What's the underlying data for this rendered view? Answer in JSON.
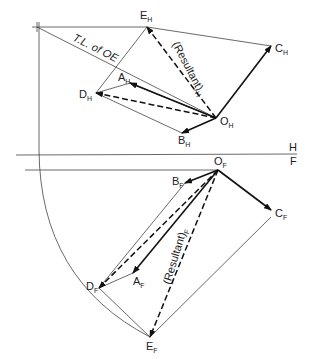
{
  "diagram": {
    "type": "descriptive-geometry-vector-resultant",
    "top_view": {
      "points": {
        "O_H": {
          "label": "O",
          "sub": "H",
          "x": 216,
          "y": 118
        },
        "A_H": {
          "label": "A",
          "sub": "H",
          "x": 130,
          "y": 83
        },
        "B_H": {
          "label": "B",
          "sub": "H",
          "x": 182,
          "y": 133
        },
        "C_H": {
          "label": "C",
          "sub": "H",
          "x": 271,
          "y": 46
        },
        "D_H": {
          "label": "D",
          "sub": "H",
          "x": 96,
          "y": 93
        },
        "E_H": {
          "label": "E",
          "sub": "H",
          "x": 147,
          "y": 27
        }
      },
      "resultant_label": "(Resultant)",
      "resultant_sub": "H",
      "true_length_label": "T.L. of OE"
    },
    "fold_line": {
      "upper": "H",
      "lower": "F"
    },
    "front_view": {
      "points": {
        "O_F": {
          "label": "O",
          "sub": "F",
          "x": 218,
          "y": 170
        },
        "A_F": {
          "label": "A",
          "sub": "F",
          "x": 133,
          "y": 273
        },
        "B_F": {
          "label": "B",
          "sub": "F",
          "x": 185,
          "y": 183
        },
        "C_F": {
          "label": "C",
          "sub": "F",
          "x": 271,
          "y": 210
        },
        "D_F": {
          "label": "D",
          "sub": "F",
          "x": 99,
          "y": 288
        },
        "E_F": {
          "label": "E",
          "sub": "F",
          "x": 150,
          "y": 337
        }
      },
      "resultant_label": "(Resultant)",
      "resultant_sub": "F"
    }
  }
}
